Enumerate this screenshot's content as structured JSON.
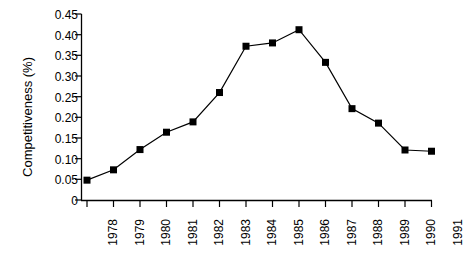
{
  "chart_data": {
    "type": "line",
    "title": "",
    "xlabel": "",
    "ylabel": "Competitiveness (%)",
    "categories": [
      "1978",
      "1979",
      "1980",
      "1981",
      "1982",
      "1983",
      "1984",
      "1985",
      "1986",
      "1987",
      "1988",
      "1989",
      "1990",
      "1991"
    ],
    "values": [
      0.048,
      0.073,
      0.122,
      0.164,
      0.189,
      0.26,
      0.372,
      0.38,
      0.412,
      0.333,
      0.221,
      0.186,
      0.121,
      0.118
    ],
    "series": [
      {
        "name": "Competitiveness",
        "values": [
          0.048,
          0.073,
          0.122,
          0.164,
          0.189,
          0.26,
          0.372,
          0.38,
          0.412,
          0.333,
          0.221,
          0.186,
          0.121,
          0.118
        ]
      }
    ],
    "ylim": [
      0,
      0.45
    ],
    "ytick_labels": [
      "0.45",
      "0.40",
      "0.35",
      "0.30",
      "0.25",
      "0.20",
      "0.15",
      "0.10",
      "0.05",
      "0"
    ],
    "ytick_values": [
      0.45,
      0.4,
      0.35,
      0.3,
      0.25,
      0.2,
      0.15,
      0.1,
      0.05,
      0
    ],
    "grid": false,
    "legend": "none",
    "marker": "filled-square",
    "line_color": "#000000",
    "marker_color": "#000000",
    "axis_color": "#000000",
    "background_color": "#ffffff"
  }
}
